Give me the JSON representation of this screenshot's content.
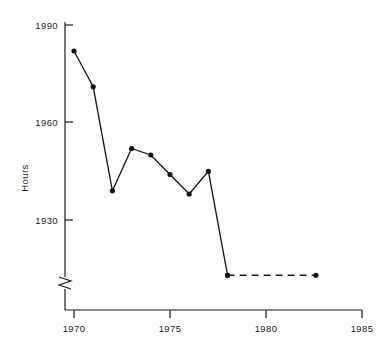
{
  "chart_data": {
    "type": "line",
    "title": "",
    "xlabel": "",
    "ylabel": "Hours",
    "xlim": [
      1968.5,
      1985.5
    ],
    "ylim": [
      1902,
      1995
    ],
    "grid": false,
    "legend": "none",
    "y_axis_break": true,
    "y_axis_break_note": "axis broken below 1930",
    "xticks": [
      1970,
      1975,
      1980,
      1985
    ],
    "xtick_labels": [
      "1970",
      "1975",
      "1980",
      "1985"
    ],
    "yticks": [
      1930,
      1960,
      1990
    ],
    "ytick_labels": [
      "1930",
      "1960",
      "1990"
    ],
    "series": [
      {
        "name": "Hours",
        "style": "solid",
        "markers": true,
        "x": [
          1970,
          1971,
          1972,
          1973,
          1974,
          1975,
          1976,
          1977,
          1978
        ],
        "values": [
          1982,
          1971,
          1939,
          1952,
          1950,
          1944,
          1938,
          1945,
          1913
        ]
      },
      {
        "name": "Hours (projected)",
        "style": "dashed",
        "markers": true,
        "x": [
          1978,
          1982.6
        ],
        "values": [
          1913,
          1913
        ]
      }
    ]
  },
  "axis": {
    "y_title": "Hours",
    "y_tick_1990": "1990",
    "y_tick_1960": "1960",
    "y_tick_1930": "1930",
    "x_tick_1970": "1970",
    "x_tick_1975": "1975",
    "x_tick_1980": "1980",
    "x_tick_1985": "1985"
  },
  "colors": {
    "ink": "#141414",
    "background": "#ffffff"
  }
}
